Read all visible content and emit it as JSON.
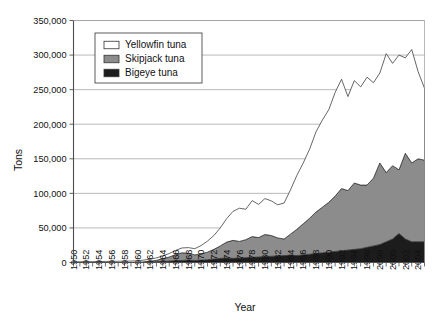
{
  "chart_data": {
    "type": "area",
    "stacked": true,
    "title": "",
    "xlabel": "Year",
    "ylabel": "Tons",
    "ylim": [
      0,
      350000
    ],
    "ytick_labels": [
      "0",
      "50,000",
      "100,000",
      "150,000",
      "200,000",
      "250,000",
      "300,000",
      "350,000"
    ],
    "ytick_values": [
      0,
      50000,
      100000,
      150000,
      200000,
      250000,
      300000,
      350000
    ],
    "grid": "horizontal",
    "legend_position": "top-left-inside",
    "x": [
      1950,
      1951,
      1952,
      1953,
      1954,
      1955,
      1956,
      1957,
      1958,
      1959,
      1960,
      1961,
      1962,
      1963,
      1964,
      1965,
      1966,
      1967,
      1968,
      1969,
      1970,
      1971,
      1972,
      1973,
      1974,
      1975,
      1976,
      1977,
      1978,
      1979,
      1980,
      1981,
      1982,
      1983,
      1984,
      1985,
      1986,
      1987,
      1988,
      1989,
      1990,
      1991,
      1992,
      1993,
      1994,
      1995,
      1996,
      1997,
      1998,
      1999,
      2000,
      2001,
      2002,
      2003,
      2004,
      2005
    ],
    "xtick_labels": [
      "1950",
      "1952",
      "1954",
      "1956",
      "1958",
      "1960",
      "1962",
      "1964",
      "1966",
      "1968",
      "1970",
      "1972",
      "1974",
      "1976",
      "1978",
      "1980",
      "1982",
      "1984",
      "1986",
      "1988",
      "1990",
      "1992",
      "1994",
      "1996",
      "2098",
      "2000",
      "2002",
      "2004"
    ],
    "xtick_values": [
      1950,
      1952,
      1954,
      1956,
      1958,
      1960,
      1962,
      1964,
      1966,
      1968,
      1970,
      1972,
      1974,
      1976,
      1978,
      1980,
      1982,
      1984,
      1986,
      1988,
      1990,
      1992,
      1994,
      1996,
      1998,
      2000,
      2002,
      2004
    ],
    "series": [
      {
        "name": "Bigeye tuna",
        "color": "#1c1c1c",
        "swatch": "filled-black",
        "values": [
          0,
          0,
          0,
          0,
          0,
          0,
          0,
          0,
          0,
          0,
          0,
          500,
          800,
          1200,
          1500,
          2000,
          2500,
          3000,
          3500,
          3000,
          3500,
          4000,
          5000,
          6000,
          6500,
          6000,
          6500,
          7000,
          7500,
          8000,
          8500,
          9000,
          9500,
          10000,
          11000,
          10000,
          11000,
          12000,
          13000,
          14000,
          15000,
          16000,
          17000,
          18000,
          19000,
          20000,
          22000,
          24000,
          26000,
          30000,
          34000,
          42000,
          34000,
          30000,
          30000,
          30000
        ]
      },
      {
        "name": "Skipjack tuna",
        "color": "#8c8c8c",
        "swatch": "filled-gray",
        "values": [
          0,
          0,
          0,
          0,
          0,
          0,
          0,
          0,
          0,
          0,
          0,
          500,
          1000,
          2000,
          4000,
          6000,
          9000,
          11000,
          10000,
          8000,
          9000,
          11000,
          14000,
          18000,
          23000,
          26000,
          24000,
          26000,
          30000,
          28000,
          32000,
          30000,
          26000,
          24000,
          30000,
          38000,
          45000,
          52000,
          60000,
          66000,
          72000,
          80000,
          90000,
          86000,
          96000,
          92000,
          90000,
          98000,
          118000,
          100000,
          106000,
          92000,
          124000,
          114000,
          120000,
          118000
        ]
      },
      {
        "name": "Yellowfin tuna",
        "color": "#ffffff",
        "swatch": "outlined-white",
        "values": [
          1000,
          1000,
          1200,
          1200,
          1500,
          1500,
          1800,
          1800,
          2000,
          2000,
          2500,
          2500,
          3000,
          3500,
          4000,
          5000,
          6000,
          7000,
          8000,
          9000,
          12000,
          16000,
          20000,
          26000,
          34000,
          42000,
          48000,
          44000,
          52000,
          48000,
          52000,
          50000,
          48000,
          52000,
          64000,
          78000,
          88000,
          100000,
          116000,
          126000,
          134000,
          150000,
          158000,
          136000,
          148000,
          142000,
          156000,
          138000,
          130000,
          172000,
          148000,
          166000,
          138000,
          164000,
          126000,
          104000
        ]
      }
    ],
    "legend_entries": [
      {
        "label": "Yellowfin tuna",
        "swatch": "outlined-white"
      },
      {
        "label": "Skipjack tuna",
        "swatch": "filled-gray"
      },
      {
        "label": "Bigeye tuna",
        "swatch": "filled-black"
      }
    ],
    "colors": {
      "yellowfin": "#ffffff",
      "skipjack": "#8c8c8c",
      "bigeye": "#1c1c1c",
      "grid": "#9a9a9a",
      "axis": "#4d4d4d",
      "outline": "#333333"
    }
  }
}
